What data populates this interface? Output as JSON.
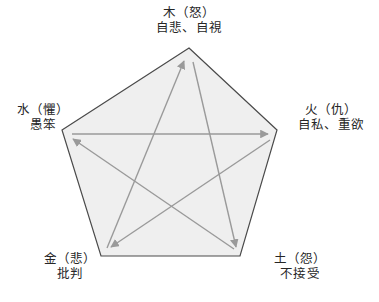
{
  "figure": {
    "type": "pentagram-cycle-diagram",
    "background_color": "#ffffff",
    "pentagon": {
      "fill_color": "#efefef",
      "stroke_color": "#4a4a4a",
      "stroke_width": 1.2
    },
    "arrows": {
      "stroke_color": "#9a9a9a",
      "stroke_width": 1.4,
      "head_style": "filled-triangle"
    },
    "nodes": [
      {
        "id": "wood",
        "position": "top",
        "element": "木",
        "emotion": "怒",
        "title": "木（怒）",
        "trait": "自悲、自視"
      },
      {
        "id": "fire",
        "position": "right",
        "element": "火",
        "emotion": "仇",
        "title": "火（仇）",
        "trait": "自私、重欲"
      },
      {
        "id": "earth",
        "position": "bottom-right",
        "element": "土",
        "emotion": "怨",
        "title": "土（怨）",
        "trait": "不接受"
      },
      {
        "id": "metal",
        "position": "bottom-left",
        "element": "金",
        "emotion": "悲",
        "title": "金（悲）",
        "trait": "批判"
      },
      {
        "id": "water",
        "position": "left",
        "element": "水",
        "emotion": "懼",
        "title": "水（懼）",
        "trait": "愚笨"
      }
    ],
    "edges": [
      {
        "from": "water",
        "to": "fire",
        "description": "水 → 火"
      },
      {
        "from": "fire",
        "to": "metal",
        "description": "火 → 金"
      },
      {
        "from": "metal",
        "to": "wood",
        "description": "金 → 木"
      },
      {
        "from": "wood",
        "to": "earth",
        "description": "木 → 土"
      },
      {
        "from": "earth",
        "to": "water",
        "description": "土 → 水"
      }
    ]
  }
}
